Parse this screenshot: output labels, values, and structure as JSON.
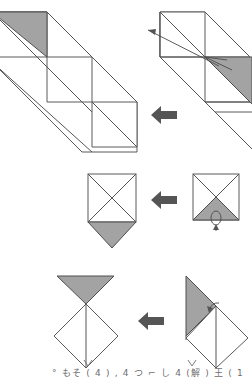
{
  "document": {
    "title": "Origami folding instruction diagram",
    "type": "paper-folding step sequence",
    "background_color": "#ffffff",
    "ink_color": "#4a4a4a",
    "shaded_color": "#a3a3a3",
    "arrow_color": "#555555",
    "reading_order": "right-to-left, top-to-bottom"
  },
  "steps": [
    {
      "id": "step-1-result",
      "row": 1,
      "position": "left",
      "label": "Unfolded diagonal strip with stepped squares and one shaded triangle at upper-left",
      "shaded_regions": 1
    },
    {
      "id": "step-1-source",
      "row": 1,
      "position": "right",
      "label": "Diagonal strip with shaded triangle at right and a thin pull arrow toward upper-left",
      "shaded_regions": 1,
      "has_thin_arrow": true
    },
    {
      "id": "step-2-result",
      "row": 2,
      "position": "left",
      "label": "Square with X creases and shaded triangle flipped down below the base",
      "shaded_regions": 1
    },
    {
      "id": "step-2-source",
      "row": 2,
      "position": "right",
      "label": "Square with X creases, lower triangle shaded, small loop arrow showing fold down",
      "shaded_regions": 1,
      "has_loop_arrow": true
    },
    {
      "id": "step-3-result",
      "row": 3,
      "position": "left",
      "label": "Shaded triangle pointing down above a white diamond with vertical crease",
      "shaded_regions": 1
    },
    {
      "id": "step-3-source",
      "row": 3,
      "position": "right",
      "label": "Shaded triangle at upper-left over a white diamond, small arrow showing rotation",
      "shaded_regions": 1,
      "has_thin_arrow": true
    }
  ],
  "arrows": [
    {
      "id": "flow-arrow-row1",
      "direction": "left",
      "x": 151,
      "y": 106,
      "width": 26,
      "height": 19
    },
    {
      "id": "flow-arrow-row2",
      "direction": "left",
      "x": 151,
      "y": 191,
      "width": 26,
      "height": 19
    },
    {
      "id": "flow-arrow-row3",
      "direction": "left",
      "x": 138,
      "y": 312,
      "width": 26,
      "height": 19
    }
  ],
  "caption": {
    "text": "° もそ ( 4 ) , 4 つ ⌐ し 4 (解 ) 王 ( 1",
    "note": "handwritten annotation, partially cropped at page edge"
  }
}
